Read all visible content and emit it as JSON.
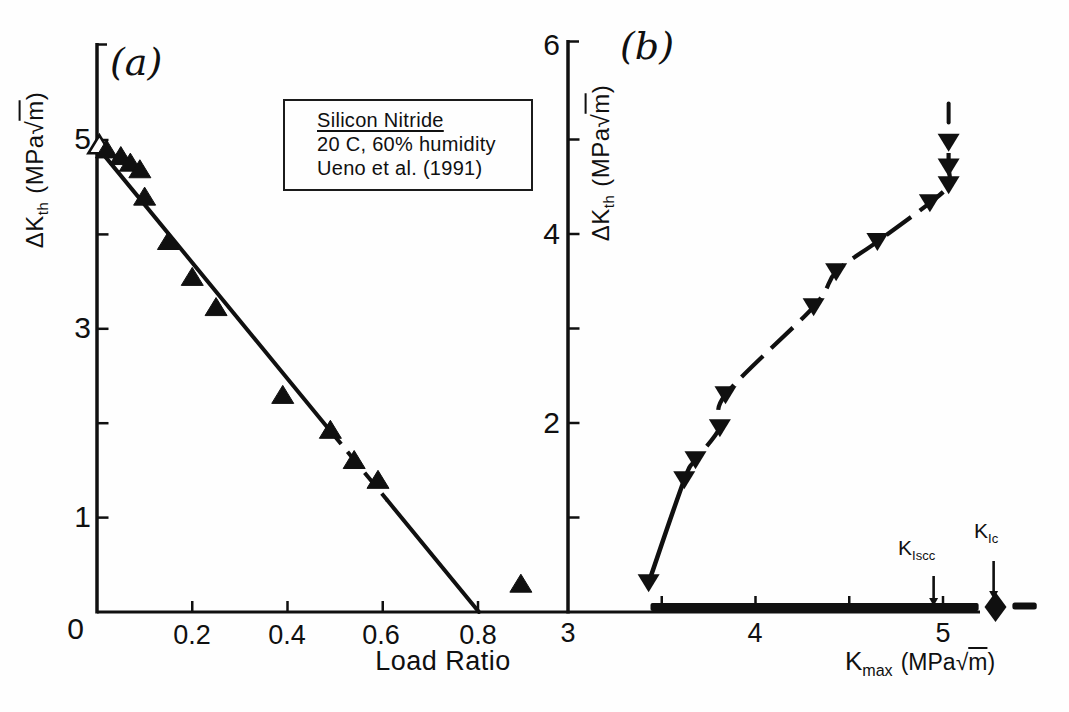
{
  "figure": {
    "panel_a_label": "(a)",
    "panel_b_label": "(b)",
    "annotation_box": {
      "line1": "Silicon Nitride",
      "line2": "20 C, 60% humidity",
      "line3": "Ueno et al. (1991)"
    },
    "ylabel": {
      "main": "ΔK",
      "sub": "th"
    },
    "units": {
      "open": "(MPa",
      "radical": "√",
      "radicand": "m",
      "close": ")"
    },
    "panel_a": {
      "xlabel": "Load Ratio",
      "ytick_labels": [
        "5",
        "3",
        "1"
      ],
      "origin_label": "0",
      "xtick_labels": [
        "0.2",
        "0.4",
        "0.6",
        "0.8"
      ]
    },
    "panel_b": {
      "xlabel_main": "K",
      "xlabel_sub": "max",
      "ytick_labels": [
        "6",
        "4",
        "2"
      ],
      "xtick_labels": [
        "3",
        "4",
        "5"
      ],
      "kiscc": {
        "main": "K",
        "sub": "Iscc"
      },
      "kic": {
        "main": "K",
        "sub": "Ic"
      }
    }
  },
  "chart_data": [
    {
      "type": "scatter",
      "panel": "a",
      "title": "(a)",
      "material": "Silicon Nitride, 20 C, 60% humidity, Ueno et al. (1991)",
      "xlabel": "Load Ratio",
      "ylabel": "ΔK_th (MPa√m)",
      "marker": "filled-up-triangle",
      "xlim": [
        0,
        0.99
      ],
      "ylim": [
        0,
        6.0
      ],
      "xticks": [
        0.2,
        0.4,
        0.6,
        0.8
      ],
      "yticks": [
        1,
        2,
        3,
        4,
        5
      ],
      "labeled_yticks": [
        1,
        3,
        5
      ],
      "grid": false,
      "points": [
        [
          0.02,
          4.9
        ],
        [
          0.05,
          4.83
        ],
        [
          0.07,
          4.76
        ],
        [
          0.09,
          4.69
        ],
        [
          0.1,
          4.4
        ],
        [
          0.15,
          3.93
        ],
        [
          0.2,
          3.55
        ],
        [
          0.25,
          3.23
        ],
        [
          0.39,
          2.3
        ],
        [
          0.49,
          1.93
        ],
        [
          0.54,
          1.61
        ],
        [
          0.59,
          1.4
        ]
      ],
      "open_point": [
        0.005,
        4.95
      ],
      "outlier_point": [
        0.89,
        0.3
      ],
      "fit_line": {
        "from": [
          0,
          4.93
        ],
        "to": [
          0.802,
          0
        ],
        "dashed_span": [
          0.49,
          0.61
        ]
      }
    },
    {
      "type": "scatter",
      "panel": "b",
      "title": "(b)",
      "xlabel": "K_max (MPa√m)",
      "ylabel": "ΔK_th (MPa√m)",
      "marker": "filled-down-triangle",
      "xlim": [
        3,
        5.6
      ],
      "ylim": [
        0,
        6.05
      ],
      "xticks": [
        3.5,
        4,
        4.5,
        5
      ],
      "labeled_xticks": [
        3,
        4,
        5
      ],
      "yticks": [
        1,
        2,
        3,
        4,
        5,
        6
      ],
      "labeled_yticks": [
        2,
        4,
        6
      ],
      "grid": false,
      "points": [
        [
          3.43,
          0.31
        ],
        [
          3.62,
          1.4
        ],
        [
          3.68,
          1.61
        ],
        [
          3.81,
          1.95
        ],
        [
          3.84,
          2.3
        ],
        [
          4.31,
          3.23
        ],
        [
          4.43,
          3.6
        ],
        [
          4.65,
          3.92
        ],
        [
          4.93,
          4.33
        ],
        [
          5.03,
          4.52
        ],
        [
          5.03,
          4.71
        ],
        [
          5.03,
          4.97
        ]
      ],
      "curve_solid_until_index": 1,
      "top_tick": {
        "x": 5.03,
        "y_from": 5.18,
        "y_to": 5.38
      },
      "axis_band": {
        "x_from": 3.44,
        "x_to": 5.19
      },
      "diamond_point": {
        "x": 5.28,
        "y": 0
      },
      "axis_end_dash": {
        "x_from": 5.37,
        "x_to": 5.5
      },
      "annotations": [
        {
          "label": "K_Iscc",
          "x": 4.95
        },
        {
          "label": "K_Ic",
          "x": 5.27
        }
      ]
    }
  ]
}
